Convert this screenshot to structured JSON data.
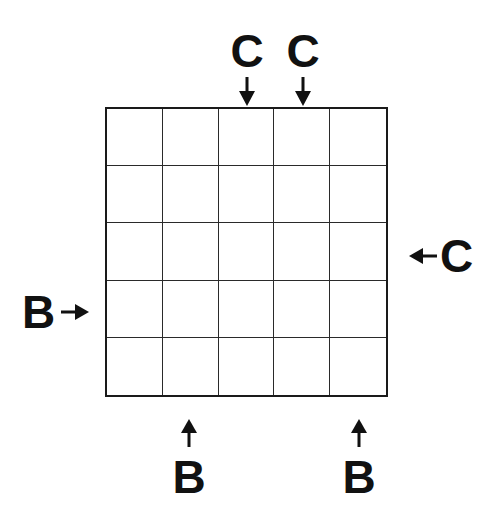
{
  "puzzle": {
    "type": "grid-clue-puzzle",
    "rows": 5,
    "cols": 5,
    "cells": [
      [
        "",
        "",
        "",
        "",
        ""
      ],
      [
        "",
        "",
        "",
        "",
        ""
      ],
      [
        "",
        "",
        "",
        "",
        ""
      ],
      [
        "",
        "",
        "",
        "",
        ""
      ],
      [
        "",
        "",
        "",
        "",
        ""
      ]
    ],
    "clues": {
      "top": [
        {
          "column": 3,
          "letter": "C",
          "arrow": "down"
        },
        {
          "column": 4,
          "letter": "C",
          "arrow": "down"
        }
      ],
      "right": [
        {
          "row": 3,
          "letter": "C",
          "arrow": "left"
        }
      ],
      "left": [
        {
          "row": 4,
          "letter": "B",
          "arrow": "right"
        }
      ],
      "bottom": [
        {
          "column": 2,
          "letter": "B",
          "arrow": "up"
        },
        {
          "column": 5,
          "letter": "B",
          "arrow": "up"
        }
      ]
    }
  },
  "colors": {
    "background": "#ffffff",
    "ink": "#111111",
    "grid_line": "#2a2a2a"
  }
}
